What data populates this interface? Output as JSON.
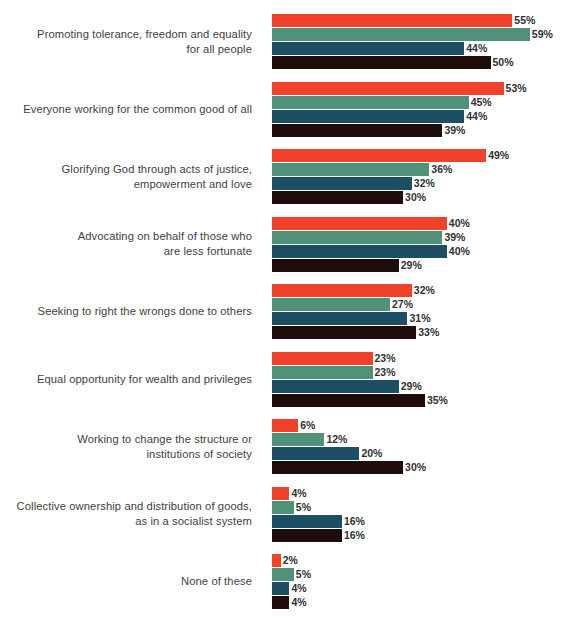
{
  "chart_data": {
    "type": "bar",
    "orientation": "horizontal",
    "grouped": true,
    "title": "",
    "subtitle": "",
    "xlabel": "",
    "ylabel": "",
    "xlim": [
      0,
      60
    ],
    "grid": false,
    "legend_position": "none",
    "value_suffix": "%",
    "categories": [
      "Promoting tolerance, freedom and equality\nfor all people",
      "Everyone working for the common good of all",
      "Glorifying God through acts of justice,\nempowerment and love",
      "Advocating on behalf of those who\nare less fortunate",
      "Seeking to right the wrongs done to others",
      "Equal opportunity for wealth and privileges",
      "Working to change the structure or\ninstitutions of society",
      "Collective ownership and distribution of goods,\nas in a socialist system",
      "None of these"
    ],
    "series": [
      {
        "name": "series-1",
        "color": "#f0412a",
        "values": [
          55,
          53,
          49,
          40,
          32,
          23,
          6,
          4,
          2
        ],
        "labels": [
          "55%",
          "53%",
          "49%",
          "40%",
          "32%",
          "23%",
          "6%",
          "4%",
          "2%"
        ]
      },
      {
        "name": "series-2",
        "color": "#4f9179",
        "values": [
          59,
          45,
          36,
          39,
          27,
          23,
          12,
          5,
          5
        ],
        "labels": [
          "59%",
          "45%",
          "36%",
          "39%",
          "27%",
          "23%",
          "12%",
          "5%",
          "5%"
        ]
      },
      {
        "name": "series-3",
        "color": "#1c4f63",
        "values": [
          44,
          44,
          32,
          40,
          31,
          29,
          20,
          16,
          4
        ],
        "labels": [
          "44%",
          "44%",
          "32%",
          "40%",
          "31%",
          "29%",
          "20%",
          "16%",
          "4%"
        ]
      },
      {
        "name": "series-4",
        "color": "#1d0c0a",
        "values": [
          50,
          39,
          30,
          29,
          33,
          35,
          30,
          16,
          4
        ],
        "labels": [
          "50%",
          "39%",
          "30%",
          "29%",
          "33%",
          "35%",
          "30%",
          "16%",
          "4%"
        ]
      }
    ]
  },
  "colors": {
    "background": "#ffffff",
    "label_text": "#3f4042",
    "value_text": "#2f3032",
    "series_1": "#f0412a",
    "series_2": "#4f9179",
    "series_3": "#1c4f63",
    "series_4": "#1d0c0a"
  }
}
